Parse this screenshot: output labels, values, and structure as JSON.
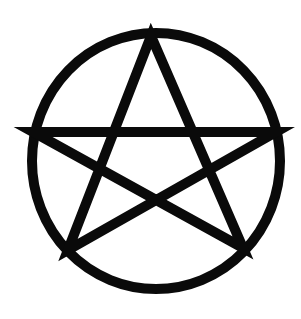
{
  "figure": {
    "stroke_color": "#0a0a0a",
    "background_color": "#ffffff",
    "circle": {
      "cx": 156,
      "cy": 161,
      "rx": 124,
      "ry": 128,
      "stroke_width": 10
    },
    "star": {
      "points": "151,36 68,250 276,132 33,132 243,248",
      "stroke_width": 10
    }
  }
}
